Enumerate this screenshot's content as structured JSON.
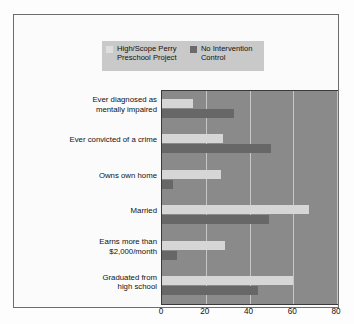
{
  "chart_data": {
    "type": "bar",
    "orientation": "horizontal",
    "title": "",
    "xlabel": "",
    "ylabel": "",
    "xlim": [
      0,
      80
    ],
    "xticks": [
      0,
      20,
      40,
      60,
      80
    ],
    "grid": true,
    "legend_position": "top",
    "categories": [
      "Ever diagnosed as\nmentally impaired",
      "Ever convicted of a crime",
      "Owns own home",
      "Married",
      "Earns more than\n$2,000/month",
      "Graduated from\nhigh school"
    ],
    "series": [
      {
        "name": "High/Scope Perry\nPreschool Project",
        "color": "#d6d6d6",
        "values": [
          14,
          28,
          27,
          67,
          29,
          60
        ]
      },
      {
        "name": "No Intervention\nControl",
        "color": "#676767",
        "values": [
          33,
          50,
          5,
          49,
          7,
          44
        ]
      }
    ]
  },
  "legend": {
    "entries": [
      {
        "label": "High/Scope Perry\nPreschool Project",
        "swatch": "light-swatch-icon"
      },
      {
        "label": "No Intervention\nControl",
        "swatch": "dark-swatch-icon"
      }
    ]
  },
  "axis": {
    "x_ticks": [
      "0",
      "20",
      "40",
      "60",
      "80"
    ]
  },
  "colors": {
    "plot_background": "#8a8a8a",
    "gridline": "#c6c6c6",
    "series_light": "#d6d6d6",
    "series_dark": "#676767",
    "legend_background": "#c9c9c9",
    "frame_border": "#6d6d6d",
    "text": "#111111"
  }
}
